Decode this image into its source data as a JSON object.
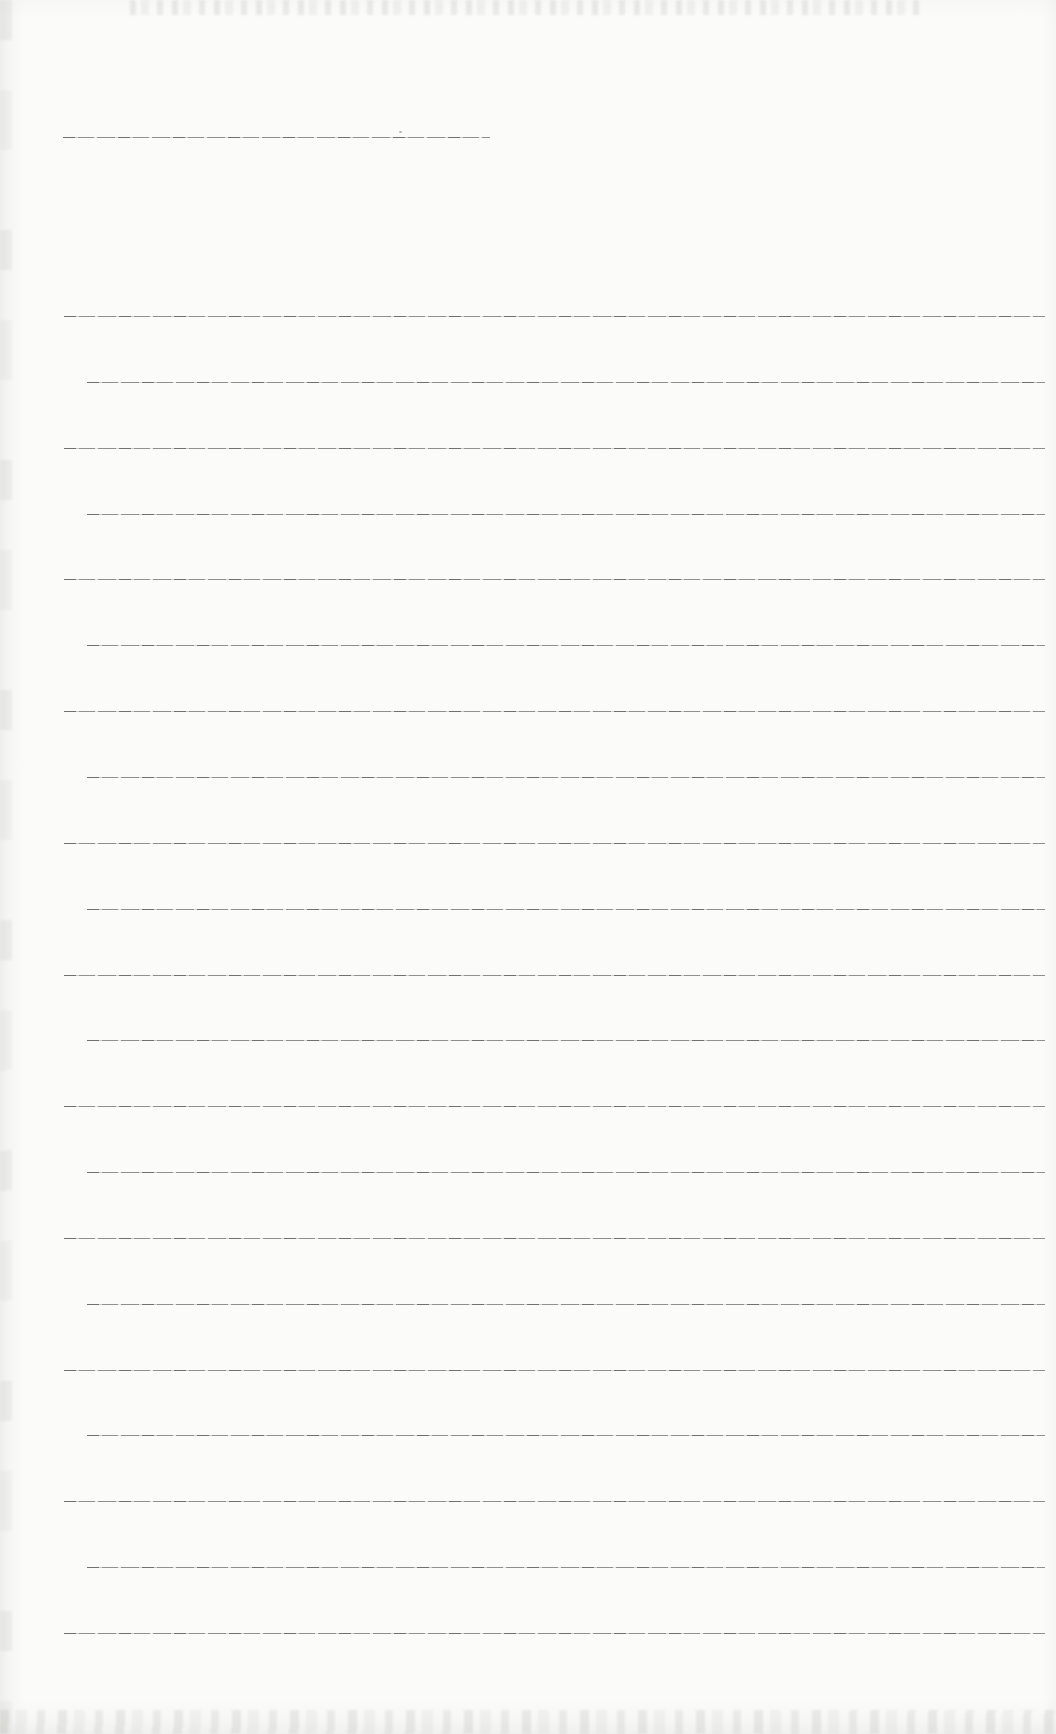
{
  "document": {
    "kind": "scanned blank ruled notebook page",
    "text_content": "",
    "paper_color": "#fbfbf9",
    "rule_color": "#6c6c6c",
    "title_rule": {
      "y": 137,
      "x1": 63,
      "x2": 490
    },
    "rules": {
      "count": 21,
      "first_y": 316,
      "spacing": 65.85,
      "x1": 64,
      "x2": 1045
    },
    "artifacts": {
      "speck": {
        "x": 399,
        "y": 131
      },
      "noise_bands": [
        "top-edge",
        "bottom-edge",
        "left-edge"
      ]
    }
  }
}
